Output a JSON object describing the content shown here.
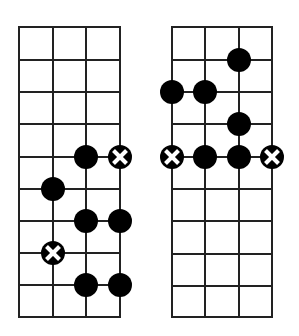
{
  "diagrams": [
    {
      "name": "left-fretboard",
      "x_lines": [
        19,
        53,
        86,
        120
      ],
      "y_lines": [
        27,
        60,
        92,
        124,
        157,
        189,
        221,
        253,
        285,
        317
      ],
      "dots": [
        {
          "string": 2,
          "fret": 4,
          "type": "dot"
        },
        {
          "string": 3,
          "fret": 4,
          "type": "root"
        },
        {
          "string": 1,
          "fret": 5,
          "type": "dot"
        },
        {
          "string": 2,
          "fret": 6,
          "type": "dot"
        },
        {
          "string": 3,
          "fret": 6,
          "type": "dot"
        },
        {
          "string": 1,
          "fret": 7,
          "type": "root"
        },
        {
          "string": 2,
          "fret": 8,
          "type": "dot"
        },
        {
          "string": 3,
          "fret": 8,
          "type": "dot"
        }
      ]
    },
    {
      "name": "right-fretboard",
      "x_lines": [
        172,
        205,
        239,
        272
      ],
      "y_lines": [
        27,
        60,
        92,
        124,
        157,
        189,
        221,
        254,
        286,
        317
      ],
      "dots": [
        {
          "string": 2,
          "fret": 1,
          "type": "dot"
        },
        {
          "string": 0,
          "fret": 2,
          "type": "dot"
        },
        {
          "string": 1,
          "fret": 2,
          "type": "dot"
        },
        {
          "string": 2,
          "fret": 3,
          "type": "dot"
        },
        {
          "string": 0,
          "fret": 4,
          "type": "root"
        },
        {
          "string": 1,
          "fret": 4,
          "type": "dot"
        },
        {
          "string": 2,
          "fret": 4,
          "type": "dot"
        },
        {
          "string": 3,
          "fret": 4,
          "type": "root"
        }
      ]
    }
  ],
  "style": {
    "line_color": "#222222",
    "dot_color": "#000000",
    "root_mark_color": "#ffffff",
    "dot_radius": 12
  }
}
